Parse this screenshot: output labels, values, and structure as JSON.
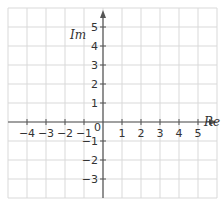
{
  "diagram": {
    "axes": {
      "x_label": "Re",
      "y_label": "Im",
      "x_ticks": [
        "-4",
        "-3",
        "-2",
        "-1",
        "1",
        "2",
        "3",
        "4",
        "5"
      ],
      "x_tick_values": [
        -4,
        -3,
        -2,
        -1,
        1,
        2,
        3,
        4,
        5
      ],
      "y_ticks": [
        "5",
        "4",
        "3",
        "2",
        "1",
        "-1",
        "-2",
        "-3"
      ],
      "y_tick_values": [
        5,
        4,
        3,
        2,
        1,
        -1,
        -2,
        -3
      ],
      "origin_label": "0",
      "x_range": [
        -5,
        6
      ],
      "y_range": [
        -4,
        6
      ]
    },
    "grid": {
      "visible": true,
      "step": 1
    },
    "colors": {
      "grid": "#d9d9d9",
      "axis": "#555555",
      "text": "#333333",
      "background": "#ffffff"
    }
  }
}
